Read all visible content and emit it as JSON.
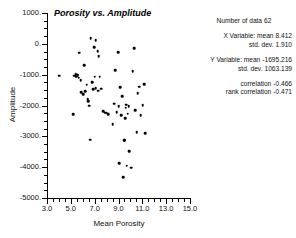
{
  "chart_data": {
    "type": "scatter",
    "title": "Porosity vs. Amplitude",
    "xlabel": "Mean Porosity",
    "ylabel": "Amplitude",
    "xlim": [
      3.0,
      15.0
    ],
    "ylim": [
      -5000,
      1000
    ],
    "xticks": [
      "3.0",
      "5.0",
      "7.0",
      "9.0",
      "11.0",
      "13.0",
      "15.0"
    ],
    "xtick_values": [
      3.0,
      5.0,
      7.0,
      9.0,
      11.0,
      13.0,
      15.0
    ],
    "yticks": [
      "1000.",
      "0.",
      "-1000.",
      "-2000.",
      "-3000.",
      "-4000.",
      "-5000."
    ],
    "ytick_values": [
      1000,
      0,
      -1000,
      -2000,
      -3000,
      -4000,
      -5000
    ],
    "grid": false,
    "legend": "none",
    "marker": "filled-circle",
    "marker_color": "#000000",
    "n": 62,
    "points": [
      [
        4.02,
        -1040
      ],
      [
        5.18,
        -2290
      ],
      [
        5.3,
        -1030
      ],
      [
        5.42,
        -985
      ],
      [
        5.46,
        -1060
      ],
      [
        5.52,
        -1000
      ],
      [
        5.58,
        -1020
      ],
      [
        5.66,
        -1100
      ],
      [
        5.7,
        -290
      ],
      [
        5.82,
        -1180
      ],
      [
        5.88,
        -1570
      ],
      [
        6.02,
        -1640
      ],
      [
        6.1,
        -690
      ],
      [
        6.22,
        -1530
      ],
      [
        6.34,
        -1330
      ],
      [
        6.42,
        -1800
      ],
      [
        6.48,
        -1870
      ],
      [
        6.56,
        -2010
      ],
      [
        6.62,
        -3110
      ],
      [
        6.66,
        190
      ],
      [
        6.78,
        -1250
      ],
      [
        6.88,
        -1480
      ],
      [
        6.96,
        -110
      ],
      [
        7.02,
        -1060
      ],
      [
        7.08,
        -1440
      ],
      [
        7.1,
        110
      ],
      [
        7.24,
        -240
      ],
      [
        7.3,
        -1520
      ],
      [
        7.34,
        -400
      ],
      [
        7.42,
        -1070
      ],
      [
        7.54,
        -1450
      ],
      [
        7.7,
        -2190
      ],
      [
        7.86,
        -2240
      ],
      [
        8.02,
        -2230
      ],
      [
        8.16,
        -2280
      ],
      [
        8.52,
        -2610
      ],
      [
        8.62,
        -1940
      ],
      [
        8.72,
        -850
      ],
      [
        8.86,
        -2210
      ],
      [
        8.96,
        -280
      ],
      [
        9.02,
        -2030
      ],
      [
        9.06,
        -3870
      ],
      [
        9.14,
        -1400
      ],
      [
        9.22,
        -2320
      ],
      [
        9.3,
        -1690
      ],
      [
        9.38,
        -4330
      ],
      [
        9.46,
        -3130
      ],
      [
        9.52,
        -3120
      ],
      [
        9.56,
        -2410
      ],
      [
        9.62,
        -2070
      ],
      [
        9.66,
        -1970
      ],
      [
        9.7,
        -3950
      ],
      [
        9.78,
        -2270
      ],
      [
        9.86,
        -2020
      ],
      [
        9.92,
        -3490
      ],
      [
        10.06,
        -4020
      ],
      [
        10.18,
        -880
      ],
      [
        10.3,
        -150
      ],
      [
        10.38,
        -2150
      ],
      [
        10.54,
        -2860
      ],
      [
        10.62,
        -1600
      ],
      [
        10.74,
        -1390
      ],
      [
        10.86,
        -2320
      ],
      [
        11.02,
        -1990
      ],
      [
        11.18,
        -1310
      ],
      [
        11.26,
        -2900
      ]
    ]
  },
  "stats": {
    "count_label": "Number of data",
    "count_value": "62",
    "x_variable_label": "X Variable: mean",
    "x_mean": "8.412",
    "x_std_label": "std. dev.",
    "x_std": "1.910",
    "y_variable_label": "Y Variable: mean",
    "y_mean": "-1695.216",
    "y_std_label": "std. dev.",
    "y_std": "1063.139",
    "correlation_label": "correlation",
    "correlation_value": "-0.466",
    "rank_correlation_label": "rank correlation",
    "rank_correlation_value": "-0.471"
  },
  "colors": {
    "marker": "#000000",
    "axis": "#000000",
    "text": "#111111",
    "background": "#ffffff"
  }
}
